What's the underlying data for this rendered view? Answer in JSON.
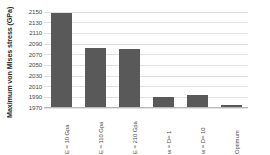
{
  "chart_data": {
    "type": "bar",
    "title": "",
    "xlabel": "",
    "ylabel": "Maximum von Mises stress (GPa)",
    "categories": [
      "E = 10 Gpa",
      "E = 110 Gpa",
      "E = 210 Gpa",
      "w = D= 1",
      "w = D= 10",
      "Optimum"
    ],
    "values": [
      2147,
      2080,
      2079,
      1988,
      1992,
      1974
    ],
    "ylim": [
      1970,
      2150
    ],
    "yticks": [
      1970,
      1990,
      2010,
      2030,
      2050,
      2070,
      2090,
      2110,
      2130,
      2150
    ],
    "ytick_labels": [
      "1970",
      "1990",
      "2010",
      "2030",
      "2050",
      "2070",
      "2090",
      "2110",
      "2130",
      "2150"
    ],
    "grid": true,
    "legend": false,
    "bar_color": "#595959",
    "grid_color": "#E2E2E2",
    "axis_color": "#B8B8B8"
  }
}
